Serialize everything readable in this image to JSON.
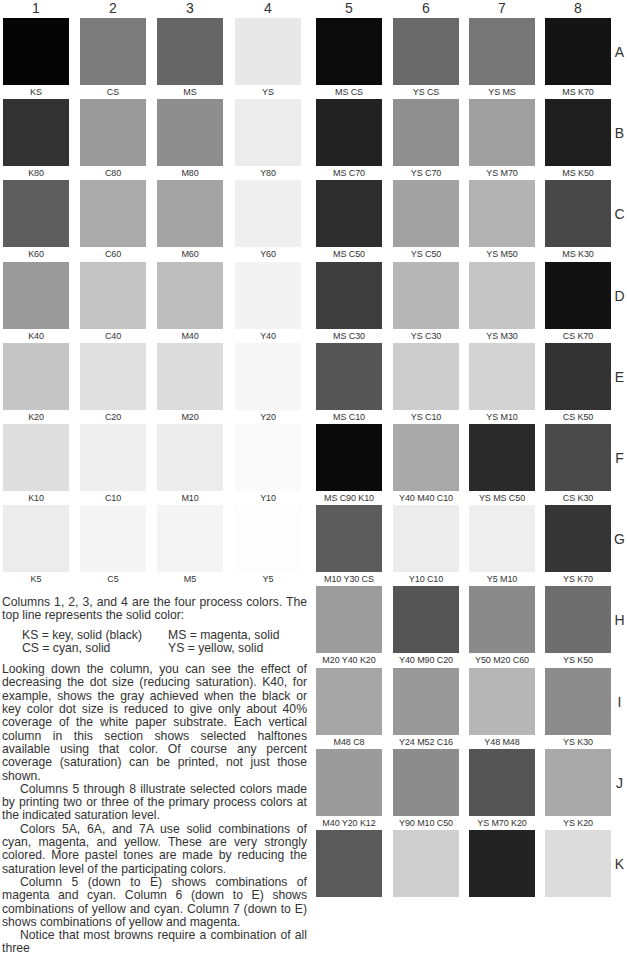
{
  "columns": [
    "1",
    "2",
    "3",
    "4",
    "5",
    "6",
    "7",
    "8"
  ],
  "rows": [
    "A",
    "B",
    "C",
    "D",
    "E",
    "F",
    "G",
    "H",
    "I",
    "J",
    "K"
  ],
  "left_grid": [
    [
      {
        "label": "KS",
        "color": "#050505"
      },
      {
        "label": "CS",
        "color": "#7c7c7c"
      },
      {
        "label": "MS",
        "color": "#666666"
      },
      {
        "label": "YS",
        "color": "#e8e8e8"
      }
    ],
    [
      {
        "label": "K80",
        "color": "#333333"
      },
      {
        "label": "C80",
        "color": "#9a9a9a"
      },
      {
        "label": "M80",
        "color": "#8e8e8e"
      },
      {
        "label": "Y80",
        "color": "#ececec"
      }
    ],
    [
      {
        "label": "K60",
        "color": "#5e5e5e"
      },
      {
        "label": "C60",
        "color": "#ababab"
      },
      {
        "label": "M60",
        "color": "#a4a4a4"
      },
      {
        "label": "Y60",
        "color": "#efefef"
      }
    ],
    [
      {
        "label": "K40",
        "color": "#9a9a9a"
      },
      {
        "label": "C40",
        "color": "#c3c3c3"
      },
      {
        "label": "M40",
        "color": "#bebebe"
      },
      {
        "label": "Y40",
        "color": "#f3f3f3"
      }
    ],
    [
      {
        "label": "K20",
        "color": "#c6c6c6"
      },
      {
        "label": "C20",
        "color": "#e0e0e0"
      },
      {
        "label": "M20",
        "color": "#dcdcdc"
      },
      {
        "label": "Y20",
        "color": "#f6f6f6"
      }
    ],
    [
      {
        "label": "K10",
        "color": "#dedede"
      },
      {
        "label": "C10",
        "color": "#efefef"
      },
      {
        "label": "M10",
        "color": "#ececec"
      },
      {
        "label": "Y10",
        "color": "#fafafa"
      }
    ],
    [
      {
        "label": "K5",
        "color": "#ececec"
      },
      {
        "label": "C5",
        "color": "#f5f5f5"
      },
      {
        "label": "M5",
        "color": "#f4f4f4"
      },
      {
        "label": "Y5",
        "color": "#fdfdfd"
      }
    ]
  ],
  "right_grid": [
    [
      {
        "label": "MS CS",
        "color": "#0c0c0c"
      },
      {
        "label": "YS CS",
        "color": "#696969"
      },
      {
        "label": "YS MS",
        "color": "#777777"
      },
      {
        "label": "MS K70",
        "color": "#141414"
      }
    ],
    [
      {
        "label": "MS C70",
        "color": "#222222"
      },
      {
        "label": "YS C70",
        "color": "#8f8f8f"
      },
      {
        "label": "YS M70",
        "color": "#a0a0a0"
      },
      {
        "label": "MS K50",
        "color": "#1e1e1e"
      }
    ],
    [
      {
        "label": "MS C50",
        "color": "#2d2d2d"
      },
      {
        "label": "YS C50",
        "color": "#a2a2a2"
      },
      {
        "label": "YS M50",
        "color": "#b3b3b3"
      },
      {
        "label": "MS K30",
        "color": "#484848"
      }
    ],
    [
      {
        "label": "MS C30",
        "color": "#3e3e3e"
      },
      {
        "label": "YS C30",
        "color": "#b7b7b7"
      },
      {
        "label": "YS M30",
        "color": "#c5c5c5"
      },
      {
        "label": "CS K70",
        "color": "#121212"
      }
    ],
    [
      {
        "label": "MS C10",
        "color": "#555555"
      },
      {
        "label": "YS C10",
        "color": "#cdcdcd"
      },
      {
        "label": "YS M10",
        "color": "#d3d3d3"
      },
      {
        "label": "CS K50",
        "color": "#333333"
      }
    ],
    [
      {
        "label": "MS C90 K10",
        "color": "#0a0a0a"
      },
      {
        "label": "Y40 M40 C10",
        "color": "#a9a9a9"
      },
      {
        "label": "YS MS C50",
        "color": "#2a2a2a"
      },
      {
        "label": "CS K30",
        "color": "#4a4a4a"
      }
    ],
    [
      {
        "label": "M10 Y30 CS",
        "color": "#5c5c5c"
      },
      {
        "label": "Y10 C10",
        "color": "#ececec"
      },
      {
        "label": "Y5 M10",
        "color": "#eeeeee"
      },
      {
        "label": "YS K70",
        "color": "#353535"
      }
    ],
    [
      {
        "label": "M20 Y40 K20",
        "color": "#9c9c9c"
      },
      {
        "label": "Y40 M90 C20",
        "color": "#555555"
      },
      {
        "label": "Y50 M20 C60",
        "color": "#8a8a8a"
      },
      {
        "label": "YS K50",
        "color": "#6e6e6e"
      }
    ],
    [
      {
        "label": "M48 C8",
        "color": "#a6a6a6"
      },
      {
        "label": "Y24 M52 C16",
        "color": "#999999"
      },
      {
        "label": "Y48 M48",
        "color": "#b6b6b6"
      },
      {
        "label": "YS K30",
        "color": "#8c8c8c"
      }
    ],
    [
      {
        "label": "M40 Y20 K12",
        "color": "#9b9b9b"
      },
      {
        "label": "Y90 M10 C50",
        "color": "#8c8c8c"
      },
      {
        "label": "YS M70 K20",
        "color": "#555555"
      },
      {
        "label": "YS K20",
        "color": "#a9a9a9"
      }
    ],
    [
      {
        "label": "",
        "color": "#5a5a5a"
      },
      {
        "label": "",
        "color": "#cfcfcf"
      },
      {
        "label": "",
        "color": "#232323"
      },
      {
        "label": "",
        "color": "#dcdcdc"
      }
    ]
  ],
  "text": {
    "p1": "Columns 1, 2, 3, and 4 are the four process colors. The top line represents the solid color:",
    "defs": [
      "KS = key, solid (black)",
      "MS = magenta, solid",
      "CS = cyan, solid",
      "YS = yellow, solid"
    ],
    "p2": "Looking down the column, you can see the effect of decreasing the dot size (reducing saturation). K40, for example, shows the gray achieved when the black or key color dot size is reduced to give only about 40% coverage of the white paper substrate. Each vertical column in this section shows selected halftones available using that color. Of course any percent coverage (saturation) can be printed, not just those shown.",
    "p3": "Columns 5 through 8 illustrate selected colors made by printing two or three of the primary process colors at the indicated saturation level.",
    "p4": "Colors 5A, 6A, and 7A use solid combinations of cyan, magenta, and yellow. These are very strongly colored. More pastel tones are made by reducing the saturation level of the participating colors.",
    "p5": "Column 5 (down to E) shows combinations of magenta and cyan. Column 6 (down to E) shows combinations of yellow and cyan. Column 7 (down to E) shows combinations of yellow and magenta.",
    "p6": "Notice that most browns require a combination of all three"
  }
}
